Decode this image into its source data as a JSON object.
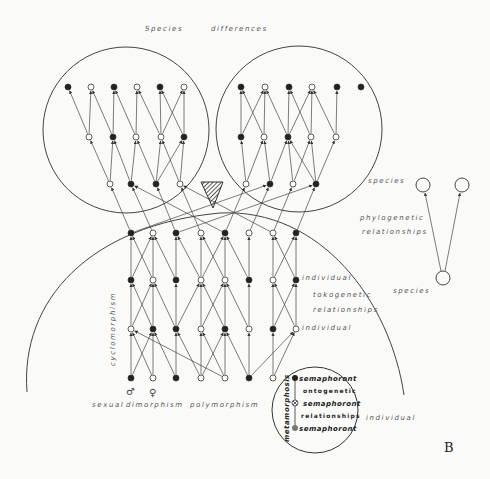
{
  "figure": {
    "panel_letter": "B",
    "title": "Species differences",
    "title_words": [
      "Species",
      "differences"
    ]
  },
  "labels": {
    "species_upper": "species",
    "phylogenetic": "phylogenetic",
    "relationships_phylo": "relationships",
    "individual_top": "individual",
    "tokogenetic": "tokogenetic",
    "relationships_toko": "relationships",
    "individual_bottom": "individual",
    "species_lower": "species",
    "individual_outer": "individual",
    "cyclomorphism": "cyclomorphism",
    "sexual": "sexual",
    "dimorphism": "dimorphism",
    "polymorphism": "polymorphism",
    "male_symbol": "♂",
    "female_symbol": "♀"
  },
  "semaphoront_inset": {
    "metamorphosis": "metamorphosis",
    "lines": [
      "semaphoront",
      "ontogenetic",
      "semaphoront",
      "relationships",
      "semaphoront"
    ]
  },
  "colors": {
    "ink": "#333333",
    "paper": "#fafaf8",
    "filled_node": "#222222",
    "open_node": "#ffffff"
  },
  "nodes": {
    "left_species": [
      {
        "y": 87,
        "row": [
          [
            68,
            1
          ],
          [
            91,
            0
          ],
          [
            114,
            1
          ],
          [
            137,
            0
          ],
          [
            160,
            1
          ],
          [
            184,
            0
          ]
        ]
      },
      {
        "y": 137,
        "row": [
          [
            89,
            0
          ],
          [
            113,
            1
          ],
          [
            136,
            0
          ],
          [
            161,
            0
          ],
          [
            184,
            1
          ]
        ]
      },
      {
        "y": 184,
        "row": [
          [
            110,
            0
          ],
          [
            131,
            1
          ],
          [
            156,
            1
          ],
          [
            180,
            0
          ]
        ]
      }
    ],
    "right_species": [
      {
        "y": 87,
        "row": [
          [
            241,
            1
          ],
          [
            265,
            0
          ],
          [
            289,
            1
          ],
          [
            312,
            0
          ],
          [
            337,
            1
          ],
          [
            361,
            1
          ]
        ]
      },
      {
        "y": 137,
        "row": [
          [
            241,
            1
          ],
          [
            264,
            0
          ],
          [
            288,
            1
          ],
          [
            311,
            0
          ],
          [
            336,
            0
          ]
        ]
      },
      {
        "y": 184,
        "row": [
          [
            246,
            0
          ],
          [
            270,
            1
          ],
          [
            293,
            0
          ],
          [
            316,
            1
          ]
        ]
      }
    ],
    "individuals": [
      {
        "y": 233,
        "row": [
          [
            131,
            1
          ],
          [
            153,
            0
          ],
          [
            176,
            1
          ],
          [
            201,
            0
          ],
          [
            225,
            1
          ],
          [
            249,
            0
          ],
          [
            273,
            0
          ],
          [
            296,
            1
          ]
        ]
      },
      {
        "y": 280,
        "row": [
          [
            131,
            1
          ],
          [
            153,
            0
          ],
          [
            176,
            1
          ],
          [
            201,
            0
          ],
          [
            225,
            0
          ],
          [
            249,
            1
          ],
          [
            273,
            0
          ],
          [
            296,
            1
          ]
        ]
      },
      {
        "y": 329,
        "row": [
          [
            131,
            0
          ],
          [
            153,
            1
          ],
          [
            176,
            1
          ],
          [
            201,
            0
          ],
          [
            225,
            1
          ],
          [
            249,
            0
          ],
          [
            273,
            1
          ],
          [
            296,
            0
          ]
        ]
      },
      {
        "y": 378,
        "row": [
          [
            131,
            1
          ],
          [
            153,
            0
          ],
          [
            176,
            1
          ],
          [
            201,
            0
          ],
          [
            225,
            0
          ],
          [
            249,
            1
          ],
          [
            273,
            0
          ]
        ]
      }
    ]
  }
}
